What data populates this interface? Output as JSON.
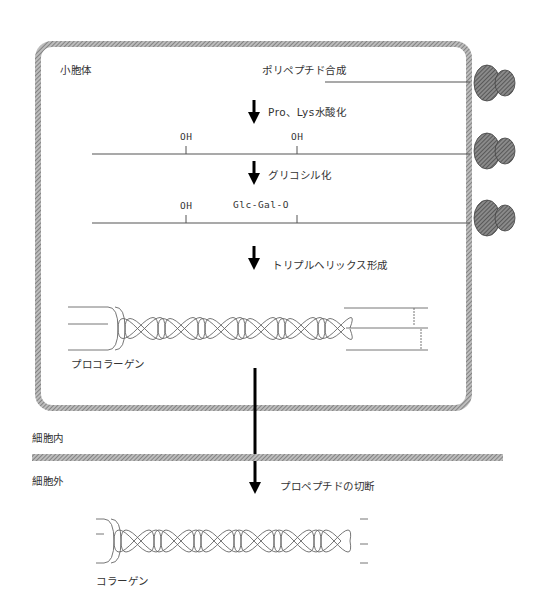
{
  "diagram": {
    "organelle_label": "小胞体",
    "steps": [
      {
        "label": "ポリペプチド合成"
      },
      {
        "label": "Pro、Lys水酸化"
      },
      {
        "label": "グリコシル化"
      },
      {
        "label": "トリプルヘリックス形成"
      },
      {
        "label": "プロペプチドの切断"
      }
    ],
    "chain1": {
      "modifications": []
    },
    "chain2": {
      "modifications": [
        "OH",
        "OH"
      ]
    },
    "chain3": {
      "modifications": [
        "OH",
        "Glc-Gal-O"
      ]
    },
    "procollagen_label": "プロコラーゲン",
    "collagen_label": "コラーゲン",
    "intracellular_label": "細胞内",
    "extracellular_label": "細胞外",
    "colors": {
      "membrane": "#8a8a8a",
      "ribosome": "#6e6e6e",
      "line": "#555555",
      "arrow": "#000000"
    }
  }
}
